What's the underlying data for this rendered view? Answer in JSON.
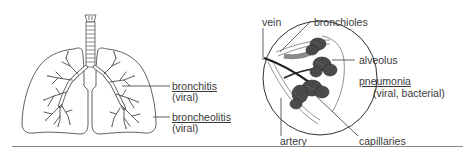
{
  "left_figure": {
    "subject": "lungs",
    "labels": [
      {
        "id": "bronchitis",
        "name": "bronchitis",
        "cause": "(viral)"
      },
      {
        "id": "broncheolitis",
        "name": "broncheolitis",
        "cause": "(viral)"
      }
    ]
  },
  "right_figure": {
    "subject": "alveolus detail (magnified circle)",
    "labels": {
      "vein": "vein",
      "bronchioles": "bronchioles",
      "alveolus": "alveolus",
      "pneumonia": "pneumonia",
      "pneumonia_cause": "(viral, bacterial)",
      "artery": "artery",
      "capillaries": "capillaries"
    }
  },
  "colors": {
    "outline": "#3a3a3a",
    "alveoli_fill": "#4a4a4a",
    "vessel_dark": "#1e1e1e",
    "rule": "#8a8a8a"
  }
}
